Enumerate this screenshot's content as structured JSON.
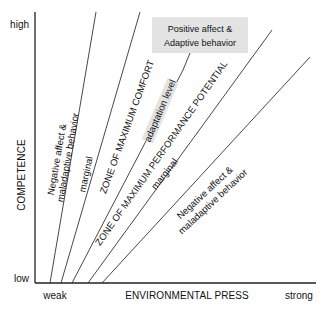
{
  "y_axis": {
    "label": "COMPETENCE",
    "high": "high",
    "low": "low"
  },
  "x_axis": {
    "label": "ENVIRONMENTAL PRESS",
    "weak": "weak",
    "strong": "strong"
  },
  "callout": {
    "line1": "Positive affect &",
    "line2": "Adaptive behavior"
  },
  "zones": {
    "upper_negative_1": "Negative affect &",
    "upper_negative_2": "maladaptive behavior",
    "upper_marginal": "marginal",
    "max_comfort": "ZONE OF MAXIMUM COMFORT",
    "adaptation_level": "adaptation level",
    "max_performance": "ZONE OF MAXIMUM PERFORMANCE POTENTIAL",
    "lower_marginal": "marginal",
    "lower_negative_1": "Negative affect &",
    "lower_negative_2": "maladaptive behavior"
  },
  "colors": {
    "callout_bg": "#e3e3e3",
    "line": "#333333"
  }
}
